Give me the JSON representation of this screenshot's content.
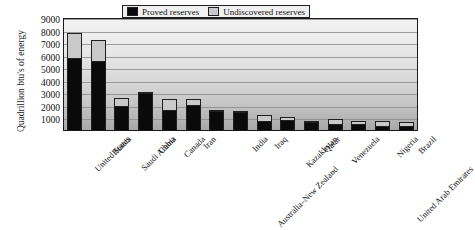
{
  "chart_data": {
    "type": "bar",
    "subtype": "stacked-bar",
    "title": "",
    "xlabel": "",
    "ylabel": "Quadrillion btu's of energy",
    "ylim": [
      0,
      9000
    ],
    "yticks": [
      1000,
      2000,
      3000,
      4000,
      5000,
      6000,
      7000,
      8000,
      9000
    ],
    "grid": true,
    "legend_position": "top-center-inside",
    "categories": [
      "United States",
      "Russia",
      "Saudi Arabia",
      "China",
      "Canada",
      "Iran",
      "Australia–New Zealand",
      "India",
      "Iraq",
      "Kazakhstan",
      "Qatar",
      "Venezuela",
      "United Arab Emirates",
      "Nigeria",
      "Brazil"
    ],
    "series": [
      {
        "name": "Proved reserves",
        "color": "#0a0a0a",
        "values": [
          5700,
          5500,
          1950,
          2950,
          1600,
          2000,
          1500,
          1400,
          750,
          800,
          600,
          500,
          450,
          350,
          300
        ]
      },
      {
        "name": "Undiscovered reserves",
        "color": "#c9c9c9",
        "values": [
          2000,
          1700,
          600,
          100,
          900,
          450,
          100,
          100,
          450,
          200,
          150,
          350,
          300,
          350,
          350
        ]
      }
    ],
    "totals": [
      7700,
      7200,
      2550,
      3050,
      2500,
      2450,
      1600,
      1500,
      1200,
      1000,
      750,
      850,
      750,
      700,
      650
    ]
  },
  "legend": {
    "entries": [
      {
        "label": "Proved reserves",
        "swatch": "black"
      },
      {
        "label": "Undiscovered reserves",
        "swatch": "gray"
      }
    ]
  },
  "axis": {
    "y_title": "Quadrillion btu's of energy"
  }
}
